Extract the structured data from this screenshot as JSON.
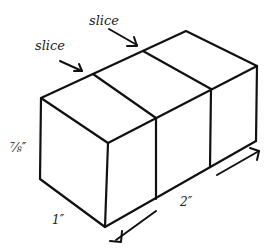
{
  "diagram": {
    "labels": {
      "slice_left": "slice",
      "slice_right": "slice",
      "height": "⅞″",
      "depth": "1″",
      "length": "2″"
    },
    "colors": {
      "stroke": "#111111",
      "background": "#ffffff"
    }
  }
}
